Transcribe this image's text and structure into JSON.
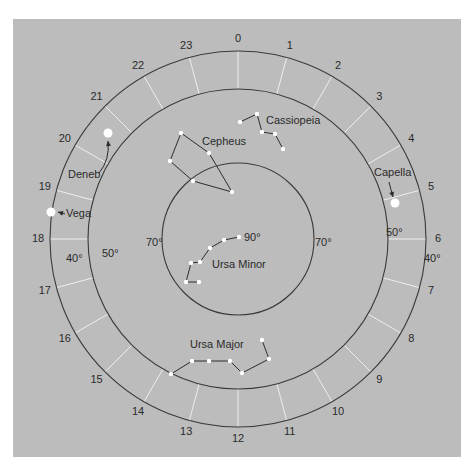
{
  "diagram": {
    "type": "star-chart",
    "center": [
      238,
      239
    ],
    "rings": {
      "outer_r": 188,
      "middle_r": 150,
      "inner_r": 76
    },
    "colors": {
      "panel": "#bcbcbc",
      "ring": "#3a3a3a",
      "tick": "#eeeeee",
      "star": "#ffffff",
      "text": "#2a2a2a"
    },
    "hours": [
      "0",
      "1",
      "2",
      "3",
      "4",
      "5",
      "6",
      "7",
      "8",
      "9",
      "10",
      "11",
      "12",
      "13",
      "14",
      "15",
      "16",
      "17",
      "18",
      "19",
      "20",
      "21",
      "22",
      "23"
    ],
    "declination_labels": [
      {
        "text": "40°",
        "x": 66,
        "y": 262
      },
      {
        "text": "50°",
        "x": 102,
        "y": 257
      },
      {
        "text": "70°",
        "x": 146,
        "y": 246
      },
      {
        "text": "90°",
        "x": 244,
        "y": 241
      },
      {
        "text": "70°",
        "x": 315,
        "y": 246
      },
      {
        "text": "50°",
        "x": 386,
        "y": 236
      },
      {
        "text": "40°",
        "x": 424,
        "y": 262
      }
    ],
    "constellations": [
      {
        "name": "Cassiopeia",
        "label": {
          "x": 266,
          "y": 124
        },
        "stars": [
          [
            240,
            122
          ],
          [
            257,
            114
          ],
          [
            262,
            132
          ],
          [
            275,
            134
          ],
          [
            283,
            149
          ]
        ],
        "lines": [
          [
            0,
            1
          ],
          [
            1,
            2
          ],
          [
            2,
            3
          ],
          [
            3,
            4
          ]
        ]
      },
      {
        "name": "Cepheus",
        "label": {
          "x": 202,
          "y": 145
        },
        "stars": [
          [
            181,
            133
          ],
          [
            209,
            153
          ],
          [
            232,
            192
          ],
          [
            193,
            181
          ],
          [
            170,
            161
          ]
        ],
        "lines": [
          [
            0,
            1
          ],
          [
            1,
            2
          ],
          [
            2,
            3
          ],
          [
            3,
            4
          ],
          [
            4,
            0
          ]
        ]
      },
      {
        "name": "Ursa Minor",
        "label": {
          "x": 212,
          "y": 268
        },
        "stars": [
          [
            239,
            237
          ],
          [
            224,
            240
          ],
          [
            210,
            248
          ],
          [
            200,
            262
          ],
          [
            191,
            263
          ],
          [
            186,
            282
          ],
          [
            199,
            282
          ]
        ],
        "lines": [
          [
            0,
            1
          ],
          [
            1,
            2
          ],
          [
            2,
            3
          ],
          [
            3,
            4
          ],
          [
            4,
            5
          ],
          [
            5,
            6
          ]
        ]
      },
      {
        "name": "Ursa Major",
        "label": {
          "x": 190,
          "y": 348
        },
        "stars": [
          [
            171,
            374
          ],
          [
            192,
            361
          ],
          [
            209,
            361
          ],
          [
            230,
            361
          ],
          [
            242,
            373
          ],
          [
            269,
            359
          ],
          [
            262,
            340
          ]
        ],
        "lines": [
          [
            0,
            1
          ],
          [
            1,
            2
          ],
          [
            2,
            3
          ],
          [
            3,
            4
          ],
          [
            4,
            5
          ],
          [
            5,
            6
          ]
        ]
      }
    ],
    "bright_stars": [
      {
        "name": "Deneb",
        "x": 108,
        "y": 133,
        "r": 4.5,
        "label": {
          "x": 68,
          "y": 178
        },
        "arrow": "M 99 173 Q 110 160 108 141"
      },
      {
        "name": "Vega",
        "x": 51,
        "y": 212,
        "r": 4.5,
        "label": {
          "x": 66,
          "y": 217
        },
        "arrow": "M 65 214 L 58 212"
      },
      {
        "name": "Capella",
        "x": 395,
        "y": 203,
        "r": 4.5,
        "label": {
          "x": 374,
          "y": 176
        },
        "arrow": "M 389 182 Q 391 190 393 197"
      }
    ]
  }
}
